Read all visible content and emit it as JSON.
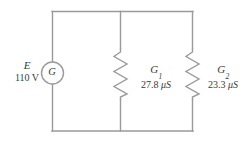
{
  "figure": {
    "line_color": "#9a9a9a",
    "text_color": "#3b3b3b",
    "background_color": "#ffffff"
  },
  "source": {
    "symbol": "E",
    "value": "110 V",
    "device_letter": "G",
    "device_name": "generator"
  },
  "branches": [
    {
      "name": "G",
      "subscript": "1",
      "value": "27.8",
      "unit": "μS",
      "component": "resistor"
    },
    {
      "name": "G",
      "subscript": "2",
      "value": "23.3",
      "unit": "μS",
      "component": "resistor"
    }
  ]
}
